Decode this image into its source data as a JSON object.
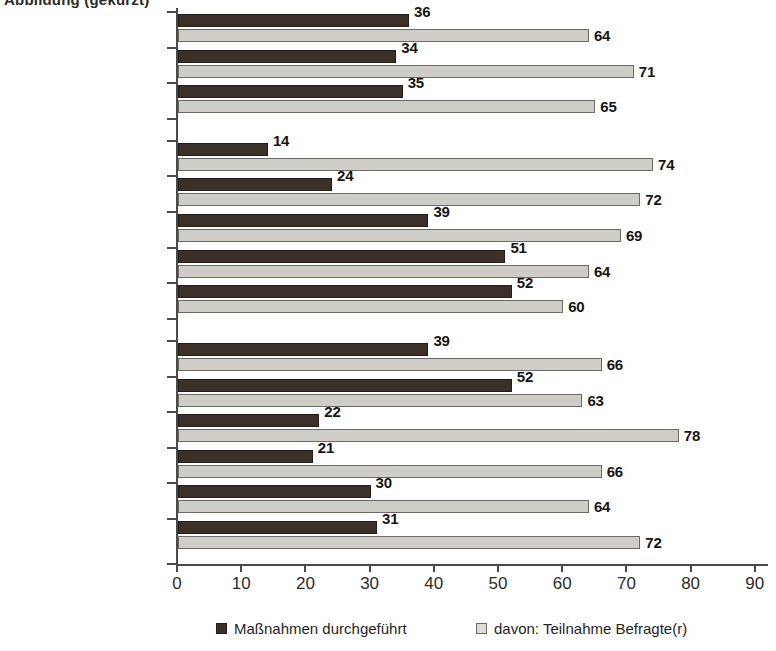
{
  "title_fragment": "Abbildung  (gekürzt)",
  "chart_data": {
    "type": "bar",
    "orientation": "horizontal",
    "title": "",
    "xlabel": "",
    "ylabel": "",
    "xlim": [
      0,
      90
    ],
    "xticks": [
      0,
      10,
      20,
      30,
      40,
      50,
      60,
      70,
      80,
      90
    ],
    "grid": false,
    "legend_position": "bottom",
    "series": [
      {
        "name": "Maßnahmen durchgeführt",
        "color": "#3b3128",
        "values": [
          36,
          34,
          35,
          14,
          24,
          39,
          51,
          52,
          39,
          52,
          22,
          21,
          30,
          31
        ]
      },
      {
        "name": "davon: Teilnahme Befragte(r)",
        "color": "#cfcdc8",
        "values": [
          64,
          71,
          65,
          74,
          72,
          69,
          64,
          60,
          66,
          63,
          78,
          66,
          64,
          72
        ]
      }
    ],
    "categories": [
      "Alte Bundesländer",
      "Neue Bundesländer",
      "Deutschland",
      "bis 9 Beschäftigte",
      "10-49",
      "50-249",
      "250-499",
      "über 500",
      "Öffentl. Dienst",
      "Industrie",
      "Handwerk",
      "Handel",
      "sonstige Dienstl.",
      "Anderer Bereich"
    ],
    "groups": [
      {
        "name": "region",
        "rows": [
          {
            "label": "Alte Bundesländer",
            "dark": 36,
            "light": 64
          },
          {
            "label": "Neue Bundesländer",
            "dark": 34,
            "light": 71
          },
          {
            "label": "Deutschland",
            "dark": 35,
            "light": 65
          }
        ]
      },
      {
        "name": "betriebsgroesse",
        "rows": [
          {
            "label": "bis 9 Beschäftigte",
            "dark": 14,
            "light": 74
          },
          {
            "label": "10-49",
            "dark": 24,
            "light": 72
          },
          {
            "label": "50-249",
            "dark": 39,
            "light": 69
          },
          {
            "label": "250-499",
            "dark": 51,
            "light": 64
          },
          {
            "label": "über 500",
            "dark": 52,
            "light": 60
          }
        ]
      },
      {
        "name": "branche",
        "rows": [
          {
            "label": "Öffentl. Dienst",
            "dark": 39,
            "light": 66
          },
          {
            "label": "Industrie",
            "dark": 52,
            "light": 63
          },
          {
            "label": "Handwerk",
            "dark": 22,
            "light": 78
          },
          {
            "label": "Handel",
            "dark": 21,
            "light": 66
          },
          {
            "label": "sonstige Dienstl.",
            "dark": 30,
            "light": 64
          },
          {
            "label": "Anderer Bereich",
            "dark": 31,
            "light": 72
          }
        ]
      }
    ]
  },
  "legend": {
    "items": [
      {
        "label": "Maßnahmen durchgeführt",
        "swatch": "dark"
      },
      {
        "label": "davon: Teilnahme Befragte(r)",
        "swatch": "light"
      }
    ]
  }
}
